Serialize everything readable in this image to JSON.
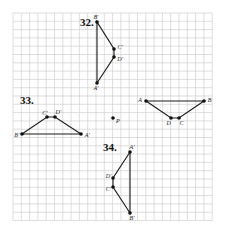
{
  "grid": {
    "x0": 13,
    "y0": 13,
    "cell": 8.3,
    "cols": 24,
    "rows": 25,
    "color": "#c8c8c8"
  },
  "center": {
    "label": "P",
    "x": 113,
    "y": 118
  },
  "original": {
    "name": "ABCD",
    "points": [
      {
        "label": "A",
        "x": 146,
        "y": 101
      },
      {
        "label": "B",
        "x": 204,
        "y": 101
      },
      {
        "label": "C",
        "x": 179,
        "y": 118
      },
      {
        "label": "D",
        "x": 171,
        "y": 118
      }
    ]
  },
  "problems": [
    {
      "number": "32.",
      "num_pos": {
        "x": 80,
        "y": 26
      },
      "points": [
        {
          "label": "A'",
          "x": 97,
          "y": 83
        },
        {
          "label": "B'",
          "x": 97,
          "y": 22
        },
        {
          "label": "C'",
          "x": 114,
          "y": 49
        },
        {
          "label": "D'",
          "x": 114,
          "y": 57
        }
      ]
    },
    {
      "number": "33.",
      "num_pos": {
        "x": 20,
        "y": 104
      },
      "points": [
        {
          "label": "A'",
          "x": 81,
          "y": 134
        },
        {
          "label": "B'",
          "x": 22,
          "y": 134
        },
        {
          "label": "C'",
          "x": 47,
          "y": 117
        },
        {
          "label": "D'",
          "x": 55,
          "y": 117
        }
      ]
    },
    {
      "number": "34.",
      "num_pos": {
        "x": 103,
        "y": 151
      },
      "points": [
        {
          "label": "A'",
          "x": 130,
          "y": 152
        },
        {
          "label": "B'",
          "x": 130,
          "y": 213
        },
        {
          "label": "C'",
          "x": 113,
          "y": 187
        },
        {
          "label": "D'",
          "x": 113,
          "y": 178
        }
      ]
    }
  ]
}
